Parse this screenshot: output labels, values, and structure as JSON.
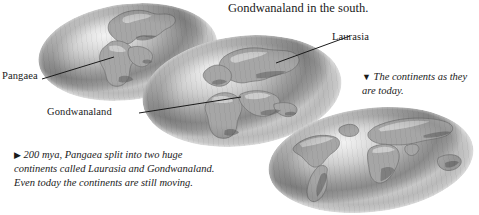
{
  "figure": {
    "heading": "Gondwanaland in the south.",
    "labels": {
      "pangaea": "Pangaea",
      "laurasia": "Laurasia",
      "gondwanaland": "Gondwanaland"
    },
    "captions": {
      "today": {
        "marker": "▼",
        "text": "The continents as they are today."
      },
      "drift": {
        "marker": "▶",
        "text": "200 mya, Pangaea  split into two huge continents called Laurasia and Gondwanaland. Even today the continents are still moving."
      }
    },
    "globes": [
      {
        "name": "globe-pangaea",
        "stage": "Pangaea"
      },
      {
        "name": "globe-split",
        "stage": "Laurasia and Gondwanaland"
      },
      {
        "name": "globe-present-day",
        "stage": "Present day continents"
      }
    ],
    "colors": {
      "background": "#ffffff",
      "text": "#1a1a1a",
      "leader_line": "#1b1b1b",
      "ocean_light": "#f2f2f2",
      "ocean_mid": "#b2b2b2",
      "ocean_dark": "#8a8a8a",
      "land": "#a6a6a6",
      "land_outline": "#6e6e6e"
    }
  }
}
